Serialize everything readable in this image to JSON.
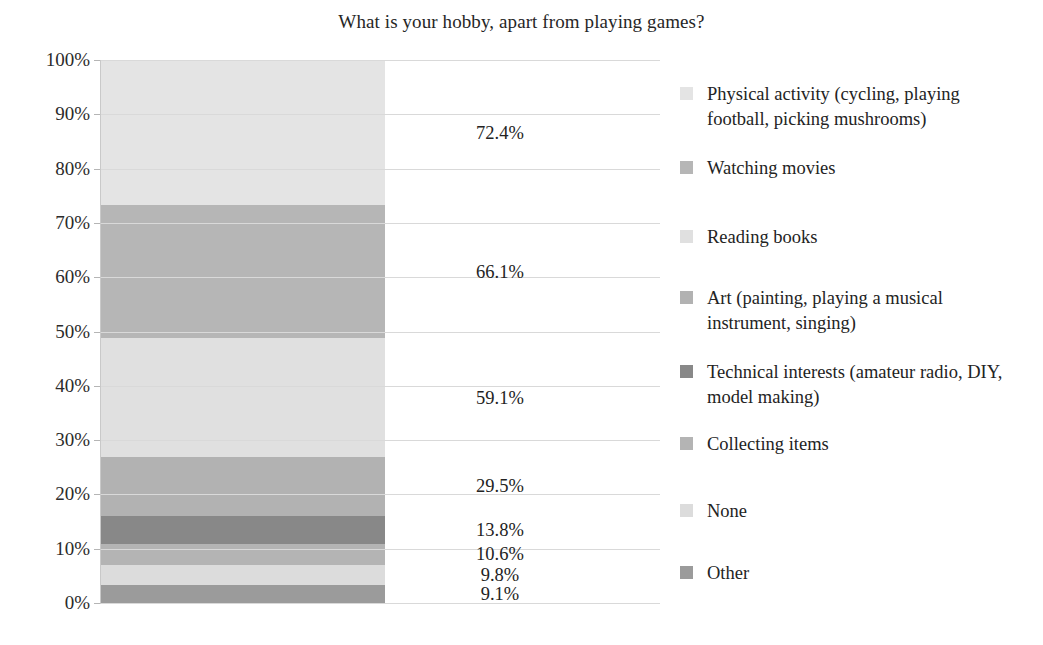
{
  "chart_data": {
    "type": "bar",
    "subtype": "100% stacked column",
    "title": "What is your hobby, apart from playing games?",
    "xlabel": "",
    "ylabel": "",
    "ylim": [
      0,
      100
    ],
    "grid": true,
    "legend_position": "right",
    "categories": [
      "Hobby"
    ],
    "ytick_labels": [
      "100%",
      "90%",
      "80%",
      "70%",
      "60%",
      "50%",
      "40%",
      "30%",
      "20%",
      "10%",
      "0%"
    ],
    "ytick_values": [
      100,
      90,
      80,
      70,
      60,
      50,
      40,
      30,
      20,
      10,
      0
    ],
    "series": [
      {
        "name": "Physical activity (cycling, playing football, picking mushrooms)",
        "value": 72.4,
        "label": "72.4%",
        "share": 26.78,
        "color": "#e4e4e4"
      },
      {
        "name": "Watching movies",
        "value": 66.1,
        "label": "66.1%",
        "share": 24.45,
        "color": "#b6b6b6"
      },
      {
        "name": "Reading books",
        "value": 59.1,
        "label": "59.1%",
        "share": 21.86,
        "color": "#e0e0e0"
      },
      {
        "name": "Art (painting, playing a musical instrument, singing)",
        "value": 29.5,
        "label": "29.5%",
        "share": 10.91,
        "color": "#b2b2b2"
      },
      {
        "name": "Technical interests (amateur radio, DIY, model making)",
        "value": 13.8,
        "label": "13.8%",
        "share": 5.1,
        "color": "#888888"
      },
      {
        "name": "Collecting items",
        "value": 10.6,
        "label": "10.6%",
        "share": 3.92,
        "color": "#b4b4b4"
      },
      {
        "name": "None",
        "value": 9.8,
        "label": "9.8%",
        "share": 3.62,
        "color": "#dcdcdc"
      },
      {
        "name": "Other",
        "value": 9.1,
        "label": "9.1%",
        "share": 3.36,
        "color": "#9b9b9b"
      }
    ],
    "legend_entries": [
      "Physical activity (cycling, playing football, picking mushrooms)",
      "Watching movies",
      "Reading books",
      "Art (painting, playing a musical instrument, singing)",
      "Technical interests (amateur radio, DIY, model making)",
      "Collecting items",
      "None",
      "Other"
    ],
    "value_labels": [
      "72.4%",
      "66.1%",
      "59.1%",
      "29.5%",
      "13.8%",
      "10.6%",
      "9.8%",
      "9.1%"
    ]
  },
  "colors": {
    "background": "#ffffff",
    "text": "#232323",
    "gridline": "#d9d9d9",
    "axis": "#c9c9c9"
  }
}
